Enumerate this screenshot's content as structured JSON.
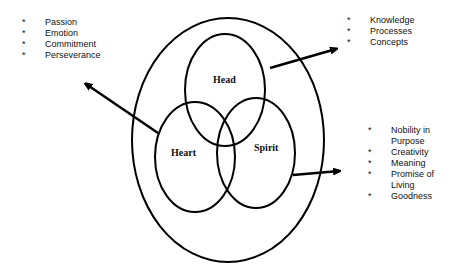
{
  "diagram": {
    "circles": {
      "head": {
        "label": "Head"
      },
      "heart": {
        "label": "Heart"
      },
      "spirit": {
        "label": "Spirit"
      }
    },
    "lists": {
      "heart_traits": {
        "bullet": "*",
        "items": [
          "Passion",
          "Emotion",
          "Commitment",
          "Perseverance"
        ]
      },
      "head_traits": {
        "bullet": "*",
        "items": [
          "Knowledge",
          "Processes",
          "Concepts"
        ]
      },
      "spirit_traits": {
        "bullet": "*",
        "items": [
          "Nobility in Purpose",
          "Creativity",
          "Meaning",
          "Promise of Living",
          "Goodness"
        ]
      }
    },
    "colors": {
      "stroke": "#000000",
      "background": "#ffffff",
      "text": "#111111"
    }
  }
}
